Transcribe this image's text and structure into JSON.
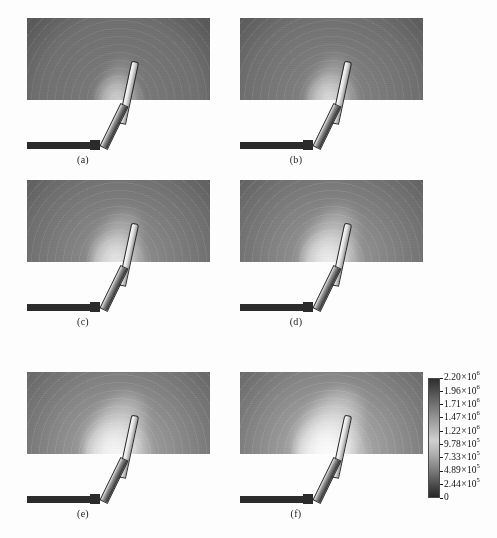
{
  "figure": {
    "type": "multi-panel-contour-plot",
    "panel_count": 6,
    "quantity": "electric field magnitude",
    "colormap": "grayscale"
  },
  "panels": [
    {
      "id": "a",
      "label": "(a)",
      "row": 1,
      "column": "left",
      "tip_intensity": 0.34,
      "glow_radius": 0.62,
      "lobe_strength": 0.3
    },
    {
      "id": "b",
      "label": "(b)",
      "row": 1,
      "column": "right",
      "tip_intensity": 0.46,
      "glow_radius": 0.68,
      "lobe_strength": 0.42
    },
    {
      "id": "c",
      "label": "(c)",
      "row": 2,
      "column": "left",
      "tip_intensity": 0.58,
      "glow_radius": 0.74,
      "lobe_strength": 0.58
    },
    {
      "id": "d",
      "label": "(d)",
      "row": 2,
      "column": "right",
      "tip_intensity": 0.68,
      "glow_radius": 0.8,
      "lobe_strength": 0.68
    },
    {
      "id": "e",
      "label": "(e)",
      "row": 3,
      "column": "left",
      "tip_intensity": 0.82,
      "glow_radius": 0.88,
      "lobe_strength": 0.84
    },
    {
      "id": "f",
      "label": "(f)",
      "row": 3,
      "column": "right",
      "tip_intensity": 0.94,
      "glow_radius": 0.94,
      "lobe_strength": 0.96
    }
  ],
  "colorbar": {
    "orientation": "vertical",
    "max_value": "2.20",
    "min_value": "0",
    "ticks": [
      {
        "mantissa": "2.20",
        "exponent": "6",
        "text": "2.20×10⁶",
        "position": 0.0
      },
      {
        "mantissa": "1.96",
        "exponent": "6",
        "text": "1.96×10⁶",
        "position": 0.111
      },
      {
        "mantissa": "1.71",
        "exponent": "6",
        "text": "1.71×10⁶",
        "position": 0.222
      },
      {
        "mantissa": "1.47",
        "exponent": "6",
        "text": "1.47×10⁶",
        "position": 0.333
      },
      {
        "mantissa": "1.22",
        "exponent": "6",
        "text": "1.22×10⁶",
        "position": 0.444
      },
      {
        "mantissa": "9.78",
        "exponent": "5",
        "text": "9.78×10⁵",
        "position": 0.555
      },
      {
        "mantissa": "7.33",
        "exponent": "5",
        "text": "7.33×10⁵",
        "position": 0.666
      },
      {
        "mantissa": "4.89",
        "exponent": "5",
        "text": "4.89×10⁵",
        "position": 0.777
      },
      {
        "mantissa": "2.44",
        "exponent": "5",
        "text": "2.44×10⁵",
        "position": 0.888
      },
      {
        "mantissa": "0",
        "exponent": "",
        "text": "0",
        "position": 1.0
      }
    ],
    "multiply_symbol": "×"
  },
  "chart_data": {
    "type": "heatmap",
    "title": "",
    "xlabel": "",
    "ylabel": "",
    "colorbar_label": "",
    "colorbar_ticks": [
      "2.20×10⁶",
      "1.96×10⁶",
      "1.71×10⁶",
      "1.47×10⁶",
      "1.22×10⁶",
      "9.78×10⁵",
      "7.33×10⁵",
      "4.89×10⁵",
      "2.44×10⁵",
      "0"
    ],
    "colorbar_range": [
      0,
      2200000
    ],
    "colormap": "gray",
    "grid": false,
    "legend_position": "right",
    "panel_labels": [
      "(a)",
      "(b)",
      "(c)",
      "(d)",
      "(e)",
      "(f)"
    ],
    "series": [
      {
        "name": "(a)",
        "peak_field": 750000
      },
      {
        "name": "(b)",
        "peak_field": 1010000
      },
      {
        "name": "(c)",
        "peak_field": 1280000
      },
      {
        "name": "(d)",
        "peak_field": 1500000
      },
      {
        "name": "(e)",
        "peak_field": 1800000
      },
      {
        "name": "(f)",
        "peak_field": 2070000
      }
    ]
  }
}
